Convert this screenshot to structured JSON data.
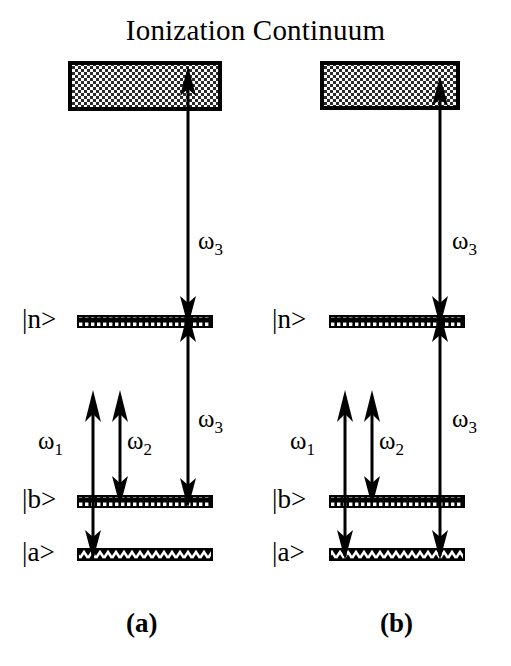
{
  "figure": {
    "title": "Ionization Continuum",
    "type": "energy-level-diagram",
    "panels": [
      {
        "id": "a",
        "label": "(a)",
        "continuum_label": "Ionization Continuum",
        "levels": [
          {
            "name": "n",
            "label": "|n>"
          },
          {
            "name": "b",
            "label": "|b>"
          },
          {
            "name": "a",
            "label": "|a>"
          }
        ],
        "transitions": [
          {
            "name": "omega1",
            "label": "ω1",
            "symbol": "ω",
            "subscript": "1",
            "from": "a",
            "to": "virtual",
            "heads": "up"
          },
          {
            "name": "omega2",
            "label": "ω2",
            "symbol": "ω",
            "subscript": "2",
            "from": "b",
            "to": "virtual",
            "heads": "both"
          },
          {
            "name": "omega3-upper",
            "label": "ω3",
            "symbol": "ω",
            "subscript": "3",
            "from": "n",
            "to": "continuum",
            "heads": "both"
          },
          {
            "name": "omega3-lower",
            "label": "ω3",
            "symbol": "ω",
            "subscript": "3",
            "from": "b",
            "to": "n",
            "heads": "both"
          }
        ]
      },
      {
        "id": "b",
        "label": "(b)",
        "levels": [
          {
            "name": "n",
            "label": "|n>"
          },
          {
            "name": "b",
            "label": "|b>"
          },
          {
            "name": "a",
            "label": "|a>"
          }
        ],
        "transitions": [
          {
            "name": "omega1",
            "label": "ω1",
            "symbol": "ω",
            "subscript": "1",
            "from": "a",
            "to": "virtual",
            "heads": "up"
          },
          {
            "name": "omega2",
            "label": "ω2",
            "symbol": "ω",
            "subscript": "2",
            "from": "b",
            "to": "virtual",
            "heads": "both"
          },
          {
            "name": "omega3-upper",
            "label": "ω3",
            "symbol": "ω",
            "subscript": "3",
            "from": "n",
            "to": "continuum",
            "heads": "both"
          },
          {
            "name": "omega3-lower",
            "label": "ω3",
            "symbol": "ω",
            "subscript": "3",
            "from": "a",
            "to": "n",
            "heads": "both"
          }
        ]
      }
    ],
    "colors": {
      "ink": "#000000",
      "background": "#ffffff",
      "hatch": "#ffffff"
    }
  },
  "text": {
    "title": "Ionization Continuum",
    "ket_n": "|n>",
    "ket_b": "|b>",
    "ket_a": "|a>",
    "panel_a": "(a)",
    "panel_b": "(b)",
    "w": "ω",
    "s1": "1",
    "s2": "2",
    "s3": "3"
  }
}
